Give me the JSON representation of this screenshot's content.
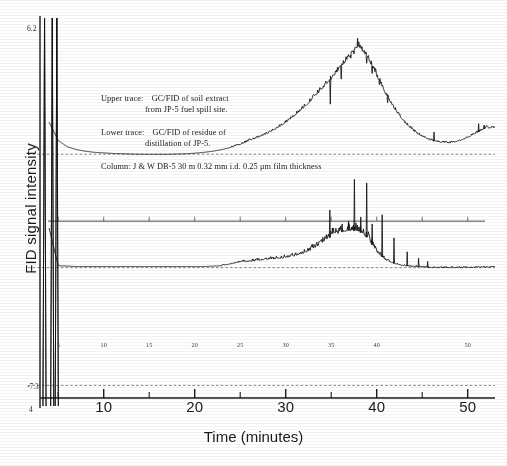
{
  "figure": {
    "title": "",
    "xlabel": "Time   (minutes)",
    "ylabel": "FID signal intensity",
    "corner_top_left": "6.2",
    "corner_bottom_left": "-7.3",
    "corner_origin": "4"
  },
  "annotations": {
    "upper_label": "Upper trace:",
    "upper_line1": "GC/FID of soil extract",
    "upper_line2": "from JP-5 fuel spill site.",
    "lower_label": "Lower trace:",
    "lower_line1": "GC/FID of residue of",
    "lower_line2": "distillation of JP-5.",
    "column_line": "Column: J & W DB-5 30 m 0.32 mm i.d. 0.25 μm film thickness"
  },
  "chart_data": {
    "type": "line",
    "xlabel": "Time   (minutes)",
    "ylabel": "FID signal intensity",
    "xlim": [
      3,
      53
    ],
    "ylim": [
      -7.3,
      6.2
    ],
    "grid": false,
    "legend_position": "none",
    "major_ticks": [
      10,
      20,
      30,
      40,
      50
    ],
    "minor_ticks": [
      5,
      15,
      25,
      35,
      45
    ],
    "inner_axis_ticks": [
      5,
      10,
      15,
      20,
      25,
      30,
      35,
      40,
      45,
      50
    ],
    "inner_axis_labels": [
      "5",
      "10",
      "15",
      "20",
      "25",
      "30",
      "35",
      "40",
      "",
      "50"
    ],
    "series": [
      {
        "name": "Upper trace: GC/FID of soil extract from JP-5 fuel spill site",
        "baseline_value": 1.45,
        "solvent_peaks_minutes": [
          3.5,
          4.35,
          4.85
        ],
        "hump_center_minutes": 38.2,
        "hump_peak_value": 5.35,
        "hump_width_minutes": 9.0,
        "tail_rise_end_value": 2.35,
        "x": [
          3.3,
          4.0,
          5.0,
          6.0,
          7.0,
          8.0,
          9.0,
          10.0,
          11.0,
          12.0,
          13.0,
          14.0,
          15.0,
          16.0,
          17.0,
          18.0,
          19.0,
          20.0,
          21.0,
          22.0,
          23.0,
          24.0,
          25.0,
          26.0,
          27.0,
          28.0,
          29.0,
          30.0,
          31.0,
          32.0,
          33.0,
          34.0,
          35.0,
          36.0,
          37.0,
          38.0,
          38.6,
          39.2,
          40.0,
          41.0,
          42.0,
          43.0,
          44.0,
          45.0,
          46.0,
          47.0,
          48.0,
          49.0,
          50.0,
          51.0,
          52.0
        ],
        "y": [
          6.2,
          2.6,
          1.95,
          1.72,
          1.62,
          1.56,
          1.52,
          1.5,
          1.48,
          1.47,
          1.46,
          1.45,
          1.45,
          1.45,
          1.45,
          1.46,
          1.47,
          1.49,
          1.52,
          1.56,
          1.62,
          1.7,
          1.8,
          1.94,
          2.06,
          2.2,
          2.38,
          2.58,
          2.84,
          3.12,
          3.45,
          3.8,
          4.15,
          4.55,
          4.95,
          5.35,
          5.1,
          4.8,
          4.25,
          3.6,
          3.05,
          2.62,
          2.3,
          2.08,
          1.95,
          1.88,
          1.86,
          1.92,
          2.05,
          2.22,
          2.4
        ]
      },
      {
        "name": "Lower trace: GC/FID of residue of distillation of JP-5",
        "baseline_value": -2.55,
        "solvent_peaks_minutes": [
          3.5,
          4.35,
          4.85
        ],
        "major_peaks_minutes": [
          34.8,
          37.6,
          38.9,
          40.6,
          42.0,
          43.4,
          44.6
        ],
        "major_peaks_values": [
          -0.55,
          0.55,
          -0.3,
          -0.75,
          -1.55,
          -2.05,
          -2.25
        ],
        "cluster_start_minutes": 33.0,
        "cluster_end_minutes": 40.0,
        "x": [
          3.3,
          4.0,
          5.0,
          7.0,
          9.0,
          11.0,
          13.0,
          15.0,
          17.0,
          19.0,
          21.0,
          23.0,
          24.0,
          25.0,
          26.0,
          27.0,
          28.0,
          29.0,
          30.0,
          31.0,
          32.0,
          33.0,
          34.0,
          35.0,
          36.0,
          37.0,
          38.0,
          39.0,
          40.0,
          41.0,
          42.0,
          43.0,
          44.0,
          45.0,
          46.0,
          48.0,
          50.0,
          52.0
        ],
        "y": [
          6.2,
          -1.2,
          -2.55,
          -2.58,
          -2.58,
          -2.58,
          -2.58,
          -2.58,
          -2.58,
          -2.58,
          -2.58,
          -2.55,
          -2.48,
          -2.42,
          -2.4,
          -2.36,
          -2.32,
          -2.3,
          -2.26,
          -2.2,
          -2.1,
          -1.95,
          -1.72,
          -1.5,
          -1.35,
          -1.28,
          -1.3,
          -1.55,
          -2.05,
          -2.35,
          -2.48,
          -2.55,
          -2.58,
          -2.6,
          -2.62,
          -2.62,
          -2.62,
          -2.6
        ]
      }
    ],
    "reference_lines": [
      {
        "name": "upper-baseline-dash",
        "value": 1.45
      },
      {
        "name": "inner-axis",
        "value": -0.95
      },
      {
        "name": "lower-baseline-dash",
        "value": -2.62
      },
      {
        "name": "bottom-dash",
        "value": -6.85
      }
    ]
  },
  "colors": {
    "trace": "#101010",
    "axis": "#1b1b1b",
    "background": "#ffffff",
    "dash": "#555555"
  }
}
